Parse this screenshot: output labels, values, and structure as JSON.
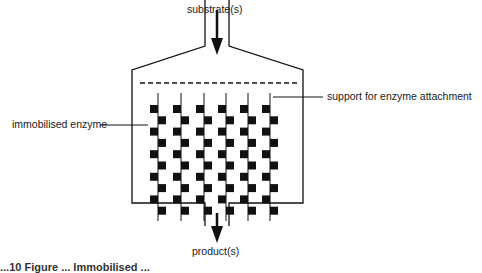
{
  "diagram": {
    "labels": {
      "inlet": "substrate(s)",
      "outlet": "product(s)",
      "support": "support for enzyme attachment",
      "enzyme": "immobilised enzyme"
    },
    "caption": "...10 Figure ... Immobilised ..."
  },
  "colors": {
    "stroke": "#111111",
    "background": "#ffffff"
  },
  "rods": {
    "count": 6,
    "x_positions": [
      158,
      181,
      204,
      226,
      248,
      270
    ],
    "blocks_per_rod": 10
  }
}
